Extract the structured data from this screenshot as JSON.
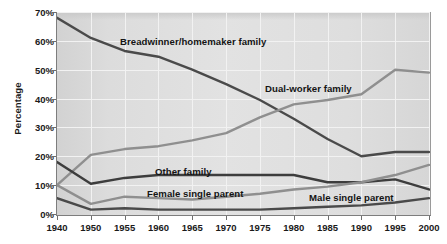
{
  "chart_data": {
    "type": "line",
    "title": "",
    "xlabel": "",
    "ylabel": "Percentage",
    "x": [
      1940,
      1950,
      1955,
      1960,
      1965,
      1970,
      1975,
      1980,
      1985,
      1990,
      1995,
      2000
    ],
    "xtick_labels": [
      "1940",
      "1950",
      "1955",
      "1960",
      "1965",
      "1970",
      "1975",
      "1980",
      "1985",
      "1990",
      "1995",
      "2000"
    ],
    "ytick_labels": [
      "0%",
      "10%",
      "20%",
      "30%",
      "40%",
      "50%",
      "60%",
      "70%"
    ],
    "ytick_values": [
      0,
      10,
      20,
      30,
      40,
      50,
      60,
      70
    ],
    "ylim": [
      0,
      70
    ],
    "grid": true,
    "legend_position": "inline-annotations",
    "series": [
      {
        "name": "Breadwinner/homemaker family",
        "color": "#4a4a4a",
        "values": [
          68,
          61,
          56.5,
          54.5,
          50,
          45,
          39.5,
          33,
          26,
          20,
          21.5,
          21.5
        ]
      },
      {
        "name": "Dual-worker family",
        "color": "#8f8f8f",
        "values": [
          10,
          20.5,
          22.5,
          23.5,
          25.5,
          28,
          33.5,
          38,
          39.5,
          41.5,
          50,
          49
        ]
      },
      {
        "name": "Other family",
        "color": "#3d3d3d",
        "values": [
          18,
          10.5,
          12.5,
          13.5,
          13.5,
          13.5,
          13.5,
          13.5,
          11,
          11,
          12,
          8.5
        ]
      },
      {
        "name": "Female single parent",
        "color": "#8f8f8f",
        "values": [
          10,
          3.5,
          6,
          5.5,
          5,
          6,
          7,
          8.5,
          9.5,
          11,
          13.5,
          17
        ]
      },
      {
        "name": "Male single parent",
        "color": "#4a4a4a",
        "values": [
          5.5,
          1.5,
          2,
          1.5,
          1.5,
          1.5,
          1.5,
          2,
          2.5,
          3,
          4,
          5.5
        ]
      }
    ],
    "annotations": [
      {
        "text": "Breadwinner/homemaker family",
        "x_px": 120,
        "y_px": 36
      },
      {
        "text": "Dual-worker family",
        "x_px": 265,
        "y_px": 83
      },
      {
        "text": "Other family",
        "x_px": 155,
        "y_px": 166
      },
      {
        "text": "Female single parent",
        "x_px": 147,
        "y_px": 188
      },
      {
        "text": "Male single parent",
        "x_px": 309,
        "y_px": 192
      }
    ]
  }
}
